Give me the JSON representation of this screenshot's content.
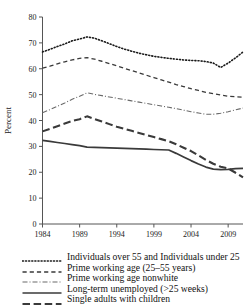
{
  "chart_data": {
    "type": "line",
    "title": "",
    "xlabel": "",
    "ylabel": "Percent",
    "xlim": [
      1984,
      2011
    ],
    "ylim": [
      0,
      80
    ],
    "ytick_step": 10,
    "grid": false,
    "legend_position": "below",
    "x": [
      1984,
      1985,
      1986,
      1987,
      1988,
      1989,
      1990,
      1991,
      1992,
      1993,
      1994,
      1995,
      1996,
      1997,
      1998,
      1999,
      2000,
      2001,
      2002,
      2003,
      2004,
      2005,
      2006,
      2007,
      2008,
      2009,
      2010,
      2011
    ],
    "yticks": [
      0,
      10,
      20,
      30,
      40,
      50,
      60,
      70,
      80
    ],
    "ytick_labels": [
      "0",
      "10",
      "20",
      "30",
      "40",
      "50",
      "60",
      "70",
      "80"
    ],
    "xticks": [
      1984,
      1989,
      1994,
      1999,
      2004,
      2009
    ],
    "xtick_labels": [
      "1984",
      "1989",
      "1994",
      "1999",
      "2004",
      "2009"
    ],
    "series": [
      {
        "name": "Individuals over 55 and Individuals under 25",
        "style": "dotted",
        "color": "#1a1a1a",
        "values": [
          66.5,
          67.5,
          68.6,
          69.6,
          70.8,
          71.5,
          72.3,
          71.8,
          70.8,
          69.7,
          68.6,
          67.6,
          66.8,
          66.0,
          65.4,
          64.8,
          64.4,
          64.0,
          63.7,
          63.4,
          63.2,
          63.1,
          62.8,
          62.2,
          60.5,
          62.2,
          64.2,
          66.5
        ]
      },
      {
        "name": "Prime working age (25–55 years)",
        "style": "dashed",
        "color": "#3a3a3a",
        "values": [
          60.2,
          61.0,
          61.9,
          62.7,
          63.4,
          64.0,
          64.3,
          63.7,
          62.9,
          62.0,
          61.1,
          60.2,
          59.3,
          58.4,
          57.5,
          56.6,
          55.7,
          54.8,
          53.9,
          53.1,
          52.3,
          51.6,
          50.9,
          50.4,
          49.9,
          49.4,
          49.2,
          49.0
        ]
      },
      {
        "name": "Prime working age nonwhite",
        "style": "dashdot",
        "color": "#6a6a6a",
        "values": [
          43.0,
          44.2,
          45.5,
          46.8,
          48.2,
          49.4,
          50.7,
          50.1,
          49.6,
          49.1,
          48.6,
          48.1,
          47.6,
          47.1,
          46.6,
          46.1,
          45.6,
          45.1,
          44.6,
          44.0,
          43.4,
          42.9,
          42.4,
          42.4,
          42.8,
          43.4,
          44.1,
          44.8
        ]
      },
      {
        "name": "Long-term unemployed (>25 weeks)",
        "style": "solid",
        "color": "#3a3a3a",
        "values": [
          32.3,
          31.9,
          31.5,
          31.1,
          30.7,
          30.3,
          29.7,
          29.6,
          29.5,
          29.4,
          29.3,
          29.2,
          29.1,
          29.0,
          28.9,
          28.8,
          28.7,
          28.6,
          27.3,
          25.9,
          24.5,
          23.2,
          22.0,
          21.2,
          21.0,
          21.1,
          21.4,
          21.5
        ]
      },
      {
        "name": "Single adults with children",
        "style": "longdash",
        "color": "#3a3a3a",
        "values": [
          35.8,
          36.8,
          37.8,
          38.8,
          39.8,
          40.5,
          41.6,
          40.6,
          39.6,
          38.6,
          37.6,
          36.8,
          36.0,
          35.2,
          34.4,
          33.6,
          32.8,
          32.0,
          30.8,
          29.5,
          28.2,
          26.5,
          24.8,
          23.3,
          22.1,
          21.5,
          19.8,
          18.0
        ]
      }
    ]
  },
  "legend": {
    "items": [
      {
        "label": "Individuals over 55 and Individuals under 25",
        "style": "dotted"
      },
      {
        "label": "Prime working age (25–55 years)",
        "style": "dashed"
      },
      {
        "label": "Prime working age nonwhite",
        "style": "dashdot"
      },
      {
        "label": "Long-term unemployed (>25 weeks)",
        "style": "solid"
      },
      {
        "label": "Single adults with children",
        "style": "longdash"
      }
    ]
  }
}
